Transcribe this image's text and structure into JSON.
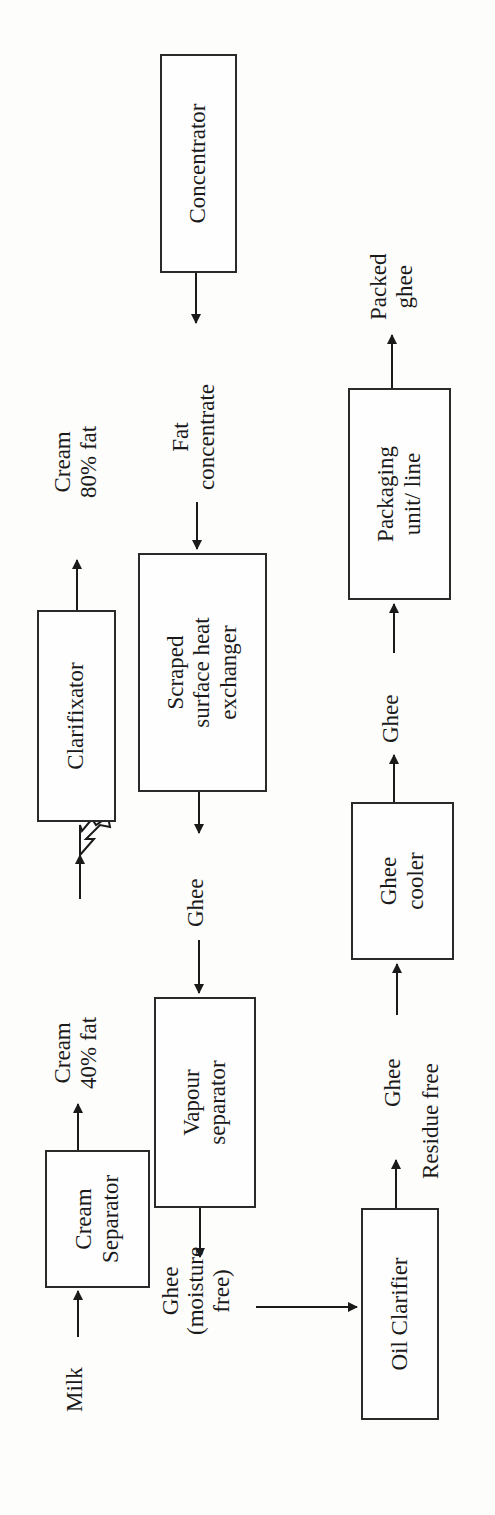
{
  "diagram": {
    "type": "process-flow",
    "orientation": "rotated-90-ccw",
    "boxes": {
      "cream_separator": "Cream Separator",
      "clarifixator": "Clarifixator",
      "concentrator": "Concentrator",
      "scraped_she": "Scraped surface heat exchanger",
      "vapour_separator": "Vapour separator",
      "oil_clarifier": "Oil Clarifier",
      "ghee_cooler": "Ghee cooler",
      "packaging": "Packaging unit/ line"
    },
    "box_lines": {
      "cream_separator": [
        "Cream",
        "Separator"
      ],
      "scraped_she": [
        "Scraped",
        "surface heat",
        "exchanger"
      ],
      "vapour_separator": [
        "Vapour",
        "separator"
      ],
      "ghee_cooler": [
        "Ghee",
        "cooler"
      ],
      "packaging": [
        "Packaging",
        "unit/ line"
      ]
    },
    "labels": {
      "milk": "Milk",
      "cream40": [
        "Cream",
        "40% fat"
      ],
      "cream80": [
        "Cream",
        "80% fat"
      ],
      "fat_concentrate": [
        "Fat",
        "concentrate"
      ],
      "ghee_1": "Ghee",
      "ghee_moisture_free": [
        "Ghee",
        "(moisture",
        "free)"
      ],
      "ghee_2": "Ghee",
      "residue_free": "Residue free",
      "ghee_3": "Ghee",
      "packed_ghee": [
        "Packed",
        "ghee"
      ]
    },
    "edges": [
      {
        "from": "Milk",
        "to": "Cream Separator"
      },
      {
        "from": "Cream Separator",
        "to": "Cream 40% fat"
      },
      {
        "from": "Cream 40% fat",
        "to": "Clarifixator"
      },
      {
        "from": "Clarifixator",
        "to": "Cream 80% fat"
      },
      {
        "from": "Concentrator",
        "to": "Fat concentrate"
      },
      {
        "from": "Fat concentrate",
        "to": "Scraped surface heat exchanger"
      },
      {
        "from": "Scraped surface heat exchanger",
        "to": "Ghee"
      },
      {
        "from": "Ghee",
        "to": "Vapour separator"
      },
      {
        "from": "Vapour separator",
        "to": "Ghee (moisture free)"
      },
      {
        "from": "Ghee (moisture free)",
        "to": "Oil Clarifier"
      },
      {
        "from": "Oil Clarifier",
        "to": "Ghee (Residue free)"
      },
      {
        "from": "Ghee (Residue free)",
        "to": "Ghee cooler"
      },
      {
        "from": "Ghee cooler",
        "to": "Ghee"
      },
      {
        "from": "Ghee",
        "to": "Packaging unit/ line"
      },
      {
        "from": "Packaging unit/ line",
        "to": "Packed ghee"
      }
    ],
    "colors": {
      "ink": "#1a1a1a",
      "paper": "#fdfdfc"
    }
  }
}
